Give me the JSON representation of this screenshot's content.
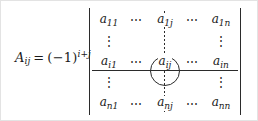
{
  "figure": {
    "kind": "math-formula-cofactor-matrix",
    "background_color": "#ffffff",
    "ink_color": "#1a1a1a",
    "border_color": "#e3e3e3"
  },
  "equation": {
    "symbol": "A",
    "symbol_subscript": "ij",
    "equals": "=",
    "open_paren": "(",
    "minus_one": "−1",
    "close_paren": ")",
    "exponent": "i+j"
  },
  "matrix": {
    "left_delimiter": "|",
    "right_delimiter": "|",
    "hdots": "⋯",
    "vdots": "⋮",
    "rows": [
      {
        "name": "row-1",
        "cells": [
          "a₁₁",
          "⋯",
          "a₁ⱼ",
          "⋯",
          "a₁ₙ"
        ],
        "entries": [
          {
            "base": "a",
            "sub": "11"
          },
          {
            "dots": "⋯"
          },
          {
            "base": "a",
            "sub": "1j"
          },
          {
            "dots": "⋯"
          },
          {
            "base": "a",
            "sub": "1n"
          }
        ]
      },
      {
        "name": "row-vdots-upper",
        "entries": [
          {
            "dots": "⋮"
          },
          {
            "blank": ""
          },
          {
            "dots": "⋮"
          },
          {
            "blank": ""
          },
          {
            "dots": "⋮"
          }
        ]
      },
      {
        "name": "row-i",
        "entries": [
          {
            "base": "a",
            "sub": "i1"
          },
          {
            "dots": "⋯"
          },
          {
            "base": "a",
            "sub": "ij"
          },
          {
            "dots": "⋯"
          },
          {
            "base": "a",
            "sub": "in"
          }
        ]
      },
      {
        "name": "row-vdots-lower",
        "entries": [
          {
            "dots": "⋮"
          },
          {
            "blank": ""
          },
          {
            "dots": "⋮"
          },
          {
            "blank": ""
          },
          {
            "dots": "⋮"
          }
        ]
      },
      {
        "name": "row-n",
        "entries": [
          {
            "base": "a",
            "sub": "n1"
          },
          {
            "dots": "⋯"
          },
          {
            "base": "a",
            "sub": "nj"
          },
          {
            "dots": "⋯"
          },
          {
            "base": "a",
            "sub": "nn"
          }
        ]
      }
    ]
  },
  "annotations": {
    "row_rule": {
      "style": "solid",
      "marks": "row i"
    },
    "column_rule": {
      "style": "dotted",
      "marks": "column j"
    },
    "highlight": {
      "shape": "circle",
      "target": "a_ij"
    }
  }
}
